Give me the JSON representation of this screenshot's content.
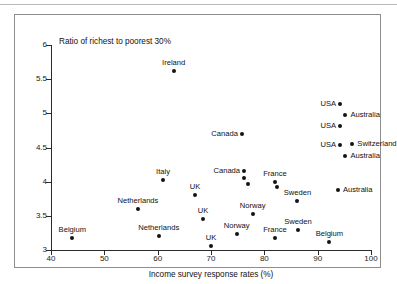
{
  "figure": {
    "plot_title": "Ratio of richest to poorest 30%",
    "xaxis_title": "Income survey response rates (%)"
  },
  "chart_data": {
    "type": "scatter",
    "title": "Ratio of richest to poorest 30%",
    "xlabel": "Income survey response rates (%)",
    "ylabel": "Ratio of richest to poorest 30%",
    "xlim": [
      40,
      100
    ],
    "ylim": [
      3,
      6
    ],
    "xticks": [
      40,
      50,
      60,
      70,
      80,
      90,
      100
    ],
    "yticks": [
      3,
      3.5,
      4,
      4.5,
      5,
      5.5,
      6
    ],
    "xtick_labels": [
      "40",
      "50",
      "60",
      "70",
      "80",
      "90",
      "100"
    ],
    "ytick_labels": [
      "3",
      "3.5",
      "4",
      "4.5",
      "5",
      "5.5",
      "6"
    ],
    "grid": false,
    "legend": "none",
    "points": [
      {
        "label": "Ireland",
        "x": 63.0,
        "y": 5.62,
        "label_pos": "above"
      },
      {
        "label": "USA",
        "x": 94.2,
        "y": 5.13,
        "label_pos": "left"
      },
      {
        "label": "Australia",
        "x": 95.2,
        "y": 4.98,
        "label_pos": "right"
      },
      {
        "label": "USA",
        "x": 94.2,
        "y": 4.82,
        "label_pos": "left"
      },
      {
        "label": "Canada",
        "x": 75.8,
        "y": 4.7,
        "label_pos": "left"
      },
      {
        "label": "USA",
        "x": 94.2,
        "y": 4.53,
        "label_pos": "left"
      },
      {
        "label": "Switzerland",
        "x": 96.5,
        "y": 4.55,
        "label_pos": "right"
      },
      {
        "label": "Australia",
        "x": 95.2,
        "y": 4.38,
        "label_pos": "right"
      },
      {
        "label": "Canada",
        "x": 76.2,
        "y": 4.16,
        "label_pos": "left"
      },
      {
        "label": "",
        "x": 76.2,
        "y": 4.05,
        "label_pos": "none"
      },
      {
        "label": "",
        "x": 76.9,
        "y": 3.97,
        "label_pos": "none"
      },
      {
        "label": "Italy",
        "x": 61.0,
        "y": 4.03,
        "label_pos": "above"
      },
      {
        "label": "France",
        "x": 82.0,
        "y": 4.0,
        "label_pos": "above"
      },
      {
        "label": "",
        "x": 82.3,
        "y": 3.92,
        "label_pos": "none"
      },
      {
        "label": "Australia",
        "x": 93.8,
        "y": 3.88,
        "label_pos": "right"
      },
      {
        "label": "UK",
        "x": 67.0,
        "y": 3.81,
        "label_pos": "above"
      },
      {
        "label": "Sweden",
        "x": 86.2,
        "y": 3.71,
        "label_pos": "above"
      },
      {
        "label": "Netherlands",
        "x": 56.3,
        "y": 3.6,
        "label_pos": "above"
      },
      {
        "label": "Norway",
        "x": 77.8,
        "y": 3.52,
        "label_pos": "above"
      },
      {
        "label": "UK",
        "x": 68.5,
        "y": 3.45,
        "label_pos": "above"
      },
      {
        "label": "Sweden",
        "x": 86.3,
        "y": 3.29,
        "label_pos": "above"
      },
      {
        "label": "Norway",
        "x": 74.8,
        "y": 3.23,
        "label_pos": "above"
      },
      {
        "label": "Netherlands",
        "x": 60.2,
        "y": 3.2,
        "label_pos": "above"
      },
      {
        "label": "Belgium",
        "x": 44.0,
        "y": 3.18,
        "label_pos": "above"
      },
      {
        "label": "France",
        "x": 82.0,
        "y": 3.17,
        "label_pos": "above"
      },
      {
        "label": "Belgium",
        "x": 92.2,
        "y": 3.12,
        "label_pos": "above"
      },
      {
        "label": "UK",
        "x": 70.0,
        "y": 3.06,
        "label_pos": "above"
      }
    ]
  }
}
